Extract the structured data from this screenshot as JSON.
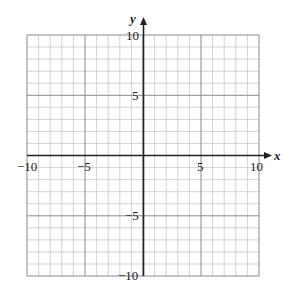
{
  "graph": {
    "x_axis": {
      "label": "x",
      "min": -10,
      "max": 10,
      "ticks": [
        "−10",
        "−5",
        "5",
        "10"
      ]
    },
    "y_axis": {
      "label": "y",
      "min": -10,
      "max": 10,
      "ticks": [
        "10",
        "5",
        "−5",
        "−10"
      ]
    },
    "grid": {
      "minor_step": 1,
      "major_step": 5
    },
    "colors": {
      "minor_grid": "#c8c8c8",
      "major_grid": "#8a8a8a",
      "axis": "#222222"
    }
  }
}
